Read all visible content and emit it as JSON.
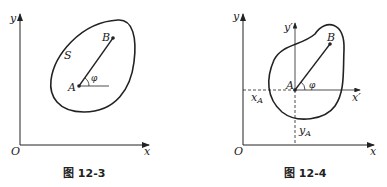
{
  "figures": [
    {
      "caption": "图 12-3",
      "labels": {
        "y": "y",
        "x": "x",
        "origin": "O",
        "A": "A",
        "B": "B",
        "S": "S",
        "angle": "φ"
      }
    },
    {
      "caption": "图 12-4",
      "labels": {
        "y": "y",
        "x": "x",
        "origin": "O",
        "A": "A",
        "B": "B",
        "y_prime": "y′",
        "x_prime": "x′",
        "xA": "x",
        "xA_sub": "A",
        "yA": "y",
        "yA_sub": "A",
        "angle": "φ"
      }
    }
  ]
}
